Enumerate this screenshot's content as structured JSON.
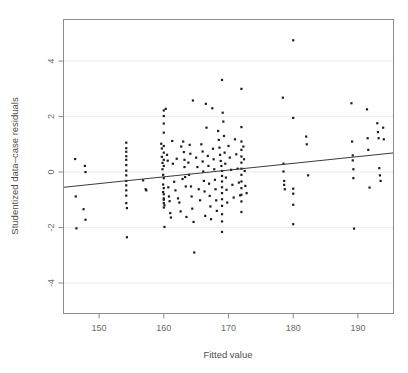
{
  "chart_data": {
    "type": "scatter",
    "title": "",
    "xlabel": "Fitted value",
    "ylabel": "Studentized data–case residuals",
    "xlim": [
      144.5,
      195.5
    ],
    "ylim": [
      -5.1,
      5.5
    ],
    "xticks": [
      150,
      160,
      170,
      180,
      190
    ],
    "yticks": [
      4,
      2,
      0,
      -2,
      -4
    ],
    "xtick_labels": [
      "150",
      "160",
      "170",
      "180",
      "190"
    ],
    "ytick_labels": [
      "4",
      "2",
      "0",
      "-2",
      "-4"
    ],
    "grid": true,
    "grid_axis": "y",
    "legend": null,
    "point_color": "#1c1c1c",
    "point_marker": "square",
    "point_size_px": 2.2,
    "fit_line": {
      "type": "linear",
      "color": "#3a3a3a",
      "x_start": 144.5,
      "y_start": -0.55,
      "x_end": 195.5,
      "y_end": 0.69,
      "slope": 0.0243,
      "intercept": -4.066
    },
    "points": [
      [
        146.3,
        0.47
      ],
      [
        146.4,
        -0.88
      ],
      [
        146.5,
        -2.03
      ],
      [
        147.8,
        0.22
      ],
      [
        147.9,
        0.0
      ],
      [
        147.6,
        -1.34
      ],
      [
        147.9,
        -1.72
      ],
      [
        154.2,
        1.06
      ],
      [
        154.2,
        0.86
      ],
      [
        154.2,
        0.73
      ],
      [
        154.2,
        0.57
      ],
      [
        154.2,
        0.44
      ],
      [
        154.2,
        0.25
      ],
      [
        154.2,
        0.05
      ],
      [
        154.2,
        -0.12
      ],
      [
        154.2,
        -0.32
      ],
      [
        154.2,
        -0.48
      ],
      [
        154.2,
        -0.66
      ],
      [
        154.2,
        -0.85
      ],
      [
        154.2,
        -1.12
      ],
      [
        154.3,
        -1.3
      ],
      [
        154.3,
        -2.35
      ],
      [
        156.8,
        -0.3
      ],
      [
        157.2,
        -0.62
      ],
      [
        157.3,
        -0.66
      ],
      [
        159.6,
        1.02
      ],
      [
        159.7,
        0.85
      ],
      [
        159.7,
        0.55
      ],
      [
        159.8,
        0.33
      ],
      [
        159.8,
        0.1
      ],
      [
        159.9,
        -0.1
      ],
      [
        159.9,
        -0.45
      ],
      [
        159.9,
        -0.72
      ],
      [
        160.0,
        -0.95
      ],
      [
        160.0,
        -1.12
      ],
      [
        160.0,
        -1.28
      ],
      [
        160.0,
        2.22
      ],
      [
        160.0,
        2.02
      ],
      [
        160.0,
        1.75
      ],
      [
        160.0,
        1.42
      ],
      [
        160.0,
        0.94
      ],
      [
        160.0,
        0.7
      ],
      [
        160.0,
        0.44
      ],
      [
        160.0,
        0.22
      ],
      [
        160.0,
        -0.22
      ],
      [
        160.0,
        -0.58
      ],
      [
        160.0,
        -0.8
      ],
      [
        160.0,
        -1.0
      ],
      [
        160.1,
        -1.2
      ],
      [
        160.1,
        -1.98
      ],
      [
        160.3,
        2.28
      ],
      [
        160.5,
        0.62
      ],
      [
        160.6,
        0.41
      ],
      [
        160.7,
        -0.55
      ],
      [
        160.8,
        -0.88
      ],
      [
        160.9,
        -1.05
      ],
      [
        161.0,
        -1.48
      ],
      [
        161.1,
        -1.64
      ],
      [
        161.3,
        1.12
      ],
      [
        161.4,
        0.3
      ],
      [
        161.6,
        -0.35
      ],
      [
        161.8,
        -0.66
      ],
      [
        162.0,
        0.48
      ],
      [
        162.2,
        -0.95
      ],
      [
        162.4,
        -1.1
      ],
      [
        162.6,
        -1.42
      ],
      [
        162.7,
        0.92
      ],
      [
        162.9,
        -0.25
      ],
      [
        163.0,
        1.1
      ],
      [
        163.1,
        0.72
      ],
      [
        163.2,
        0.44
      ],
      [
        163.2,
        0.18
      ],
      [
        163.3,
        -0.18
      ],
      [
        163.4,
        -0.52
      ],
      [
        163.5,
        -1.62
      ],
      [
        163.8,
        0.34
      ],
      [
        163.9,
        -0.1
      ],
      [
        164.0,
        0.98
      ],
      [
        164.1,
        0.66
      ],
      [
        164.2,
        -0.52
      ],
      [
        164.3,
        -0.88
      ],
      [
        164.4,
        -1.32
      ],
      [
        164.5,
        2.58
      ],
      [
        164.6,
        -1.8
      ],
      [
        164.7,
        -2.9
      ],
      [
        165.0,
        0.52
      ],
      [
        165.2,
        0.18
      ],
      [
        165.4,
        -0.62
      ],
      [
        165.6,
        -1.02
      ],
      [
        165.8,
        1.0
      ],
      [
        166.0,
        0.74
      ],
      [
        166.0,
        0.38
      ],
      [
        166.1,
        0.02
      ],
      [
        166.2,
        -0.32
      ],
      [
        166.3,
        -0.7
      ],
      [
        166.4,
        -1.58
      ],
      [
        166.5,
        2.46
      ],
      [
        166.6,
        1.6
      ],
      [
        166.8,
        0.58
      ],
      [
        166.9,
        0.22
      ],
      [
        167.0,
        -0.42
      ],
      [
        167.1,
        -0.86
      ],
      [
        167.2,
        -1.24
      ],
      [
        167.3,
        -1.7
      ],
      [
        167.5,
        2.3
      ],
      [
        167.6,
        0.84
      ],
      [
        167.7,
        0.46
      ],
      [
        167.8,
        0.1
      ],
      [
        167.9,
        -0.28
      ],
      [
        168.0,
        -0.62
      ],
      [
        168.1,
        -1.02
      ],
      [
        168.2,
        -1.4
      ],
      [
        168.4,
        1.48
      ],
      [
        168.5,
        1.16
      ],
      [
        168.6,
        0.88
      ],
      [
        168.7,
        0.62
      ],
      [
        168.8,
        0.4
      ],
      [
        168.9,
        0.22
      ],
      [
        169.0,
        0.04
      ],
      [
        169.0,
        -0.14
      ],
      [
        169.0,
        -0.34
      ],
      [
        169.0,
        -0.55
      ],
      [
        169.0,
        -0.76
      ],
      [
        169.0,
        -0.98
      ],
      [
        169.0,
        -1.22
      ],
      [
        169.0,
        -1.52
      ],
      [
        169.0,
        -1.78
      ],
      [
        169.0,
        -2.16
      ],
      [
        169.0,
        3.32
      ],
      [
        169.1,
        2.14
      ],
      [
        169.2,
        1.82
      ],
      [
        169.3,
        1.3
      ],
      [
        169.4,
        0.7
      ],
      [
        169.5,
        0.3
      ],
      [
        169.6,
        -0.2
      ],
      [
        169.7,
        -0.64
      ],
      [
        169.8,
        -1.1
      ],
      [
        170.0,
        0.94
      ],
      [
        170.2,
        0.52
      ],
      [
        170.4,
        0.08
      ],
      [
        170.6,
        -0.46
      ],
      [
        170.8,
        -0.92
      ],
      [
        171.0,
        1.18
      ],
      [
        171.2,
        0.64
      ],
      [
        171.4,
        0.12
      ],
      [
        171.6,
        -0.38
      ],
      [
        171.8,
        -0.84
      ],
      [
        172.0,
        3.0
      ],
      [
        172.0,
        1.62
      ],
      [
        172.0,
        1.1
      ],
      [
        172.0,
        0.8
      ],
      [
        172.0,
        0.56
      ],
      [
        172.0,
        0.34
      ],
      [
        172.0,
        0.12
      ],
      [
        172.0,
        -0.1
      ],
      [
        172.0,
        -0.34
      ],
      [
        172.0,
        -0.58
      ],
      [
        172.0,
        -0.82
      ],
      [
        172.0,
        -1.06
      ],
      [
        172.0,
        -1.44
      ],
      [
        172.3,
        0.92
      ],
      [
        172.4,
        0.46
      ],
      [
        172.5,
        0.04
      ],
      [
        172.6,
        -0.5
      ],
      [
        172.8,
        -0.76
      ],
      [
        178.4,
        2.68
      ],
      [
        178.5,
        0.3
      ],
      [
        178.5,
        0.02
      ],
      [
        178.6,
        -0.32
      ],
      [
        178.6,
        -0.46
      ],
      [
        178.7,
        -0.62
      ],
      [
        180.0,
        4.75
      ],
      [
        180.0,
        1.95
      ],
      [
        180.0,
        -0.6
      ],
      [
        180.0,
        -0.78
      ],
      [
        180.0,
        -1.18
      ],
      [
        180.0,
        -1.88
      ],
      [
        182.0,
        1.28
      ],
      [
        182.1,
        1.0
      ],
      [
        182.3,
        -0.12
      ],
      [
        189.0,
        2.48
      ],
      [
        189.1,
        1.1
      ],
      [
        189.2,
        0.6
      ],
      [
        189.2,
        0.42
      ],
      [
        189.3,
        0.1
      ],
      [
        189.3,
        -0.22
      ],
      [
        189.4,
        -2.04
      ],
      [
        191.4,
        2.26
      ],
      [
        191.5,
        1.22
      ],
      [
        191.6,
        0.8
      ],
      [
        191.8,
        -0.56
      ],
      [
        193.0,
        1.76
      ],
      [
        193.1,
        1.44
      ],
      [
        193.2,
        1.22
      ],
      [
        193.3,
        0.14
      ],
      [
        193.4,
        -0.12
      ],
      [
        193.5,
        -0.32
      ],
      [
        193.9,
        1.6
      ],
      [
        194.0,
        1.18
      ]
    ]
  }
}
